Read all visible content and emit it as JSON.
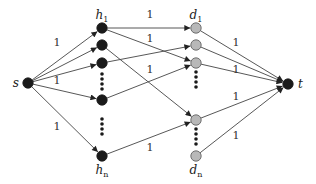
{
  "diagram": {
    "title": "",
    "colors": {
      "edge": "#444444",
      "dark_node": "#1a1a1a",
      "light_node_fill": "#b8b8b8",
      "light_node_stroke": "#555555"
    },
    "nodes": [
      {
        "id": "s",
        "label": "s",
        "x": 28,
        "y": 83,
        "kind": "dark"
      },
      {
        "id": "h1",
        "label": "h",
        "sub": "1",
        "x": 102,
        "y": 28,
        "kind": "dark"
      },
      {
        "id": "h2",
        "label": "",
        "x": 102,
        "y": 45,
        "kind": "dark"
      },
      {
        "id": "h3",
        "label": "",
        "x": 102,
        "y": 63,
        "kind": "dark"
      },
      {
        "id": "h4",
        "label": "",
        "x": 102,
        "y": 100,
        "kind": "dark"
      },
      {
        "id": "hn",
        "label": "h",
        "sub": "n",
        "x": 102,
        "y": 156,
        "kind": "dark"
      },
      {
        "id": "d1",
        "label": "d",
        "sub": "1",
        "x": 196,
        "y": 28,
        "kind": "light"
      },
      {
        "id": "d2",
        "label": "",
        "x": 196,
        "y": 45,
        "kind": "light"
      },
      {
        "id": "d3",
        "label": "",
        "x": 196,
        "y": 63,
        "kind": "light"
      },
      {
        "id": "d4",
        "label": "",
        "x": 196,
        "y": 120,
        "kind": "light"
      },
      {
        "id": "dn",
        "label": "d",
        "sub": "n",
        "x": 196,
        "y": 156,
        "kind": "light"
      },
      {
        "id": "t",
        "label": "t",
        "x": 288,
        "y": 84,
        "kind": "dark"
      }
    ],
    "ellipses": [
      {
        "x": 102,
        "y1": 74,
        "y2": 89,
        "kind": "dark"
      },
      {
        "x": 102,
        "y1": 119,
        "y2": 134,
        "kind": "dark"
      },
      {
        "x": 196,
        "y1": 72,
        "y2": 87,
        "kind": "dark"
      },
      {
        "x": 196,
        "y1": 129,
        "y2": 144,
        "kind": "dark"
      }
    ],
    "edges": [
      {
        "from": "s",
        "to": "h1",
        "label": "1",
        "lx": 57,
        "ly": 46
      },
      {
        "from": "s",
        "to": "h2",
        "label": ""
      },
      {
        "from": "s",
        "to": "h3",
        "label": "1",
        "lx": 57,
        "ly": 84
      },
      {
        "from": "s",
        "to": "h4",
        "label": ""
      },
      {
        "from": "s",
        "to": "hn",
        "label": "1",
        "lx": 57,
        "ly": 130
      },
      {
        "from": "h1",
        "to": "d1",
        "label": "1",
        "lx": 150,
        "ly": 18
      },
      {
        "from": "h1",
        "to": "d3",
        "label": "1",
        "lx": 150,
        "ly": 42
      },
      {
        "from": "h2",
        "to": "d4",
        "label": ""
      },
      {
        "from": "h3",
        "to": "d2",
        "label": ""
      },
      {
        "from": "h4",
        "to": "d3",
        "label": "1",
        "lx": 150,
        "ly": 73
      },
      {
        "from": "hn",
        "to": "d4",
        "label": "1",
        "lx": 150,
        "ly": 151
      },
      {
        "from": "d1",
        "to": "t",
        "label": "1",
        "lx": 236,
        "ly": 46
      },
      {
        "from": "d2",
        "to": "t",
        "label": ""
      },
      {
        "from": "d3",
        "to": "t",
        "label": "1",
        "lx": 236,
        "ly": 73
      },
      {
        "from": "d4",
        "to": "t",
        "label": "1",
        "lx": 236,
        "ly": 100
      },
      {
        "from": "dn",
        "to": "t",
        "label": "1",
        "lx": 236,
        "ly": 139
      }
    ]
  }
}
